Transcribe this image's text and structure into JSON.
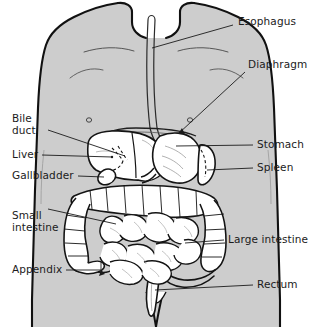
{
  "diagram": {
    "type": "anatomical-line-diagram",
    "colors": {
      "body_fill": "#cdcdcd",
      "body_outline": "#111111",
      "organ_fill": "#ffffff",
      "organ_outline": "#141414",
      "leader_line": "#1b1b1b",
      "label_text": "#1b1b1b",
      "background": "#ffffff"
    },
    "labels": [
      {
        "id": "esophagus",
        "text": "Esophagus",
        "lines": [
          "Esophagus"
        ],
        "x": 238,
        "y": 22,
        "side": "right",
        "leader": true,
        "arrow": false
      },
      {
        "id": "diaphragm",
        "text": "Diaphragm",
        "lines": [
          "Diaphragm"
        ],
        "x": 248,
        "y": 65,
        "side": "right",
        "leader": true,
        "arrow": true
      },
      {
        "id": "stomach",
        "text": "Stomach",
        "lines": [
          "Stomach"
        ],
        "x": 257,
        "y": 141,
        "side": "right",
        "leader": true,
        "arrow": false
      },
      {
        "id": "spleen",
        "text": "Spleen",
        "lines": [
          "Spleen"
        ],
        "x": 257,
        "y": 164,
        "side": "right",
        "leader": true,
        "arrow": false
      },
      {
        "id": "large-intestine",
        "text": "Large intestine",
        "lines": [
          "Large intestine"
        ],
        "x": 228,
        "y": 236,
        "side": "right",
        "leader": true,
        "arrow": false
      },
      {
        "id": "rectum",
        "text": "Rectum",
        "lines": [
          "Rectum"
        ],
        "x": 257,
        "y": 281,
        "side": "right",
        "leader": true,
        "arrow": false
      },
      {
        "id": "bile-duct",
        "text": "Bile duct",
        "lines": [
          "Bile",
          "duct"
        ],
        "x": 12,
        "y": 112,
        "side": "left",
        "leader": true,
        "arrow": false
      },
      {
        "id": "liver",
        "text": "Liver",
        "lines": [
          "Liver"
        ],
        "x": 12,
        "y": 150,
        "side": "left",
        "leader": true,
        "arrow": false
      },
      {
        "id": "gallbladder",
        "text": "Gallbladder",
        "lines": [
          "Gallbladder"
        ],
        "x": 12,
        "y": 171,
        "side": "left",
        "leader": true,
        "arrow": false
      },
      {
        "id": "small-intestine",
        "text": "Small intestine",
        "lines": [
          "Small",
          "intestine"
        ],
        "x": 12,
        "y": 209,
        "side": "left",
        "leader": true,
        "arrow": false
      },
      {
        "id": "appendix",
        "text": "Appendix",
        "lines": [
          "Appendix"
        ],
        "x": 12,
        "y": 267,
        "side": "left",
        "leader": true,
        "arrow": true
      }
    ],
    "organs": [
      "esophagus",
      "diaphragm",
      "stomach",
      "spleen",
      "liver",
      "gallbladder",
      "bile duct",
      "small intestine",
      "large intestine",
      "appendix",
      "rectum"
    ]
  }
}
